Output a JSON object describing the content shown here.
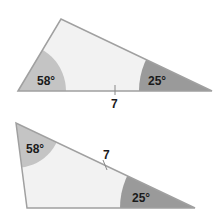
{
  "diagrams": [
    {
      "angles": [
        {
          "label": "58°",
          "vertex": "left"
        },
        {
          "label": "25°",
          "vertex": "right"
        }
      ],
      "side_label": "7",
      "side": "base"
    },
    {
      "angles": [
        {
          "label": "58°",
          "vertex": "top-left"
        },
        {
          "label": "25°",
          "vertex": "right"
        }
      ],
      "side_label": "7",
      "side": "hypotenuse"
    }
  ],
  "colors": {
    "fill": "#f2f2f2",
    "angle_light": "#c4c4c4",
    "angle_dark": "#9a9a9a",
    "stroke": "#a0a0a0"
  }
}
